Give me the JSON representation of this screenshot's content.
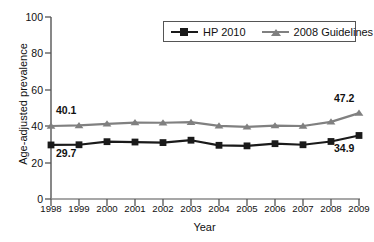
{
  "chart_data": {
    "type": "line",
    "title": "",
    "xlabel": "Year",
    "ylabel": "Age-adjusted prevalence",
    "categories": [
      "1998",
      "1999",
      "2000",
      "2001",
      "2002",
      "2003",
      "2004",
      "2005",
      "2006",
      "2007",
      "2008",
      "2009"
    ],
    "x": [
      1998,
      1999,
      2000,
      2001,
      2002,
      2003,
      2004,
      2005,
      2006,
      2007,
      2008,
      2009
    ],
    "ylim": [
      0,
      100
    ],
    "yticks": [
      0,
      20,
      40,
      60,
      80,
      100
    ],
    "grid": false,
    "legend_position": "top-right",
    "series": [
      {
        "name": "HP 2010",
        "color": "#1a1a1a",
        "marker": "square",
        "values": [
          29.7,
          29.8,
          31.5,
          31.3,
          31.0,
          32.3,
          29.5,
          29.2,
          30.4,
          29.8,
          31.6,
          34.9
        ]
      },
      {
        "name": "2008 Guidelines",
        "color": "#808080",
        "marker": "triangle",
        "values": [
          40.1,
          40.4,
          41.3,
          42.0,
          41.9,
          42.2,
          40.2,
          39.6,
          40.3,
          40.1,
          42.4,
          47.2
        ]
      }
    ],
    "annotations": [
      {
        "text": "40.1",
        "series": "2008 Guidelines",
        "x": 1998,
        "y": 40.1,
        "placement": "above-left"
      },
      {
        "text": "29.7",
        "series": "HP 2010",
        "x": 1998,
        "y": 29.7,
        "placement": "below-left"
      },
      {
        "text": "47.2",
        "series": "2008 Guidelines",
        "x": 2009,
        "y": 47.2,
        "placement": "above-right"
      },
      {
        "text": "34.9",
        "series": "HP 2010",
        "x": 2009,
        "y": 34.9,
        "placement": "below-right"
      }
    ]
  },
  "legend": {
    "items": [
      {
        "label": "HP 2010"
      },
      {
        "label": "2008 Guidelines"
      }
    ]
  },
  "axis": {
    "y_title": "Age-adjusted prevalence",
    "x_title": "Year",
    "y_tick_labels": [
      "100",
      "80",
      "60",
      "40",
      "20",
      "0"
    ],
    "x_tick_labels": [
      "1998",
      "1999",
      "2000",
      "2001",
      "2002",
      "2003",
      "2004",
      "2005",
      "2006",
      "2007",
      "2008",
      "2009"
    ]
  },
  "annotations": {
    "left_upper": "40.1",
    "left_lower": "29.7",
    "right_upper": "47.2",
    "right_lower": "34.9"
  },
  "colors": {
    "series_hp2010": "#1a1a1a",
    "series_guidelines": "#808080",
    "axis": "#555555",
    "text": "#111111",
    "background": "#ffffff"
  }
}
